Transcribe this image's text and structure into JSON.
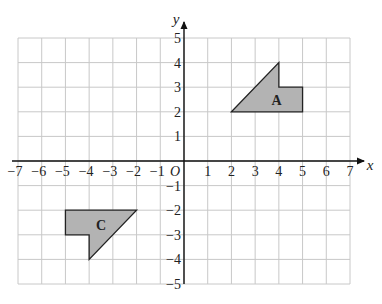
{
  "diagram": {
    "type": "coordinate-grid",
    "axes": {
      "x_label": "x",
      "y_label": "y",
      "origin_label": "O",
      "x_min": -7,
      "x_max": 7,
      "y_min": -5,
      "y_max": 5,
      "x_tick_labels": [
        "−7",
        "−6",
        "−5",
        "−4",
        "−3",
        "−2",
        "−1",
        "1",
        "2",
        "3",
        "4",
        "5",
        "6",
        "7"
      ],
      "x_tick_values": [
        -7,
        -6,
        -5,
        -4,
        -3,
        -2,
        -1,
        1,
        2,
        3,
        4,
        5,
        6,
        7
      ],
      "y_tick_labels": [
        "5",
        "4",
        "3",
        "2",
        "1",
        "−1",
        "−2",
        "−3",
        "−4",
        "−5"
      ],
      "y_tick_values": [
        5,
        4,
        3,
        2,
        1,
        -1,
        -2,
        -3,
        -4,
        -5
      ]
    },
    "shapes": [
      {
        "label": "A",
        "fill": "#b3b3b3",
        "stroke": "#222222",
        "vertices": [
          [
            2,
            2
          ],
          [
            4,
            4
          ],
          [
            4,
            3
          ],
          [
            5,
            3
          ],
          [
            5,
            2
          ]
        ],
        "label_position": [
          3.9,
          2.5
        ]
      },
      {
        "label": "C",
        "fill": "#b3b3b3",
        "stroke": "#222222",
        "vertices": [
          [
            -5,
            -2
          ],
          [
            -2,
            -2
          ],
          [
            -4,
            -4
          ],
          [
            -4,
            -3
          ],
          [
            -5,
            -3
          ]
        ],
        "label_position": [
          -3.5,
          -2.6
        ]
      }
    ],
    "colors": {
      "grid": "#c8c8c8",
      "axis": "#111111",
      "text": "#222222"
    }
  }
}
